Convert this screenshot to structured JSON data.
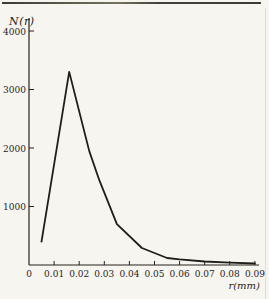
{
  "figure": {
    "background_color": "#f7f5f0",
    "axis_color": "#26231c",
    "curve_color": "#211e18",
    "text_color": "#26231c"
  },
  "chart_data": {
    "type": "line",
    "title": "",
    "ylabel": "N(r)",
    "xlabel": "r(mm)",
    "x": [
      0.005,
      0.016,
      0.024,
      0.028,
      0.035,
      0.045,
      0.055,
      0.06,
      0.07,
      0.08,
      0.09
    ],
    "y": [
      400,
      3300,
      1950,
      1450,
      700,
      290,
      120,
      95,
      60,
      40,
      25
    ],
    "xlim": [
      0,
      0.092
    ],
    "ylim": [
      0,
      4220
    ],
    "x_ticks": [
      0,
      0.01,
      0.02,
      0.03,
      0.04,
      0.05,
      0.06,
      0.07,
      0.08,
      0.09
    ],
    "x_tick_labels": [
      "0",
      "0.01",
      "0.02",
      "0.03",
      "0.04",
      "0.05",
      "0.06",
      "0.07",
      "0.08",
      "0.09"
    ],
    "y_ticks": [
      1000,
      2000,
      3000,
      4000
    ],
    "y_tick_labels": [
      "1000",
      "2000",
      "3000",
      "4000"
    ],
    "grid": false,
    "legend": null,
    "peak": {
      "r": 0.016,
      "N": 3300
    }
  }
}
